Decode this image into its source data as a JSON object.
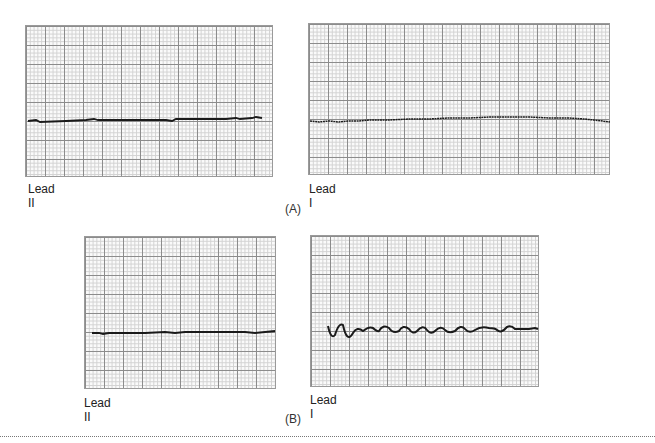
{
  "figure": {
    "parts": [
      {
        "label": "(A)",
        "panels": [
          {
            "lead": "Lead II",
            "trace": "flat-line",
            "description": "Near-isoelectric flat line with minimal noise"
          },
          {
            "lead": "Lead I",
            "trace": "flat-line-fine-undulation",
            "description": "Flat line with fine fibrillatory undulation"
          }
        ]
      },
      {
        "label": "(B)",
        "panels": [
          {
            "lead": "Lead II",
            "trace": "flat-line",
            "description": "Flat line"
          },
          {
            "lead": "Lead I",
            "trace": "damped-sinusoid",
            "description": "Sinusoidal oscillation ~12 cycles, decaying amplitude, then flat"
          }
        ]
      }
    ],
    "colors": {
      "trace": "#1a1a1a",
      "grid_major": "#8c8c8c",
      "grid_minor": "#d2d2d2",
      "background": "#ffffff"
    }
  }
}
